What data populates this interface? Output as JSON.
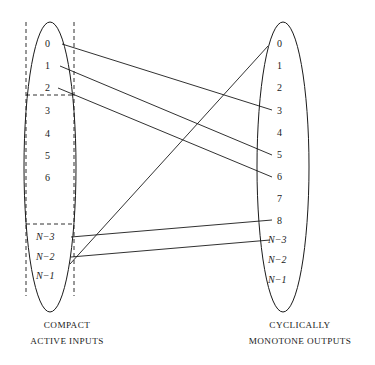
{
  "figure": {
    "type": "bipartite-mapping-diagram",
    "background": "#ffffff",
    "stroke_color": "#1a1a1a"
  },
  "left_set": {
    "name": "compact-active-inputs",
    "caption_line1": "COMPACT",
    "caption_line2": "ACTIVE INPUTS",
    "ellipse": {
      "cx": 50,
      "cy": 167,
      "rx": 26,
      "ry": 145
    },
    "items": [
      {
        "label": "0",
        "x": 45,
        "y": 45
      },
      {
        "label": "1",
        "x": 45,
        "y": 67
      },
      {
        "label": "2",
        "x": 45,
        "y": 89
      },
      {
        "label": "3",
        "x": 45,
        "y": 112
      },
      {
        "label": "4",
        "x": 45,
        "y": 135
      },
      {
        "label": "5",
        "x": 45,
        "y": 157
      },
      {
        "label": "6",
        "x": 45,
        "y": 179
      },
      {
        "label": "N−3",
        "x": 36,
        "y": 238
      },
      {
        "label": "N−2",
        "x": 36,
        "y": 258
      },
      {
        "label": "N−1",
        "x": 36,
        "y": 277
      }
    ]
  },
  "right_set": {
    "name": "cyclically-monotone-outputs",
    "caption_line1": "CYCLICALLY",
    "caption_line2": "MONOTONE OUTPUTS",
    "ellipse": {
      "cx": 283,
      "cy": 167,
      "rx": 26,
      "ry": 145
    },
    "items": [
      {
        "label": "0",
        "x": 277,
        "y": 45
      },
      {
        "label": "1",
        "x": 277,
        "y": 67
      },
      {
        "label": "2",
        "x": 277,
        "y": 89
      },
      {
        "label": "3",
        "x": 277,
        "y": 112
      },
      {
        "label": "4",
        "x": 277,
        "y": 134
      },
      {
        "label": "5",
        "x": 277,
        "y": 156
      },
      {
        "label": "6",
        "x": 277,
        "y": 178
      },
      {
        "label": "7",
        "x": 277,
        "y": 200
      },
      {
        "label": "8",
        "x": 277,
        "y": 222
      },
      {
        "label": "N−3",
        "x": 268,
        "y": 241
      },
      {
        "label": "N−2",
        "x": 268,
        "y": 261
      },
      {
        "label": "N−1",
        "x": 268,
        "y": 281
      }
    ]
  },
  "mappings": [
    {
      "from": "0",
      "to": "3",
      "x1": 62,
      "y1": 44,
      "x2": 272,
      "y2": 110
    },
    {
      "from": "1",
      "to": "5",
      "x1": 60,
      "y1": 66,
      "x2": 272,
      "y2": 155
    },
    {
      "from": "2",
      "to": "6",
      "x1": 58,
      "y1": 88,
      "x2": 272,
      "y2": 177
    },
    {
      "from": "N−3",
      "to": "8",
      "x1": 71,
      "y1": 237,
      "x2": 272,
      "y2": 220
    },
    {
      "from": "N−2",
      "to": "N−3",
      "x1": 71,
      "y1": 257,
      "x2": 270,
      "y2": 240
    },
    {
      "from": "N−1",
      "to": "0",
      "x1": 70,
      "y1": 264,
      "x2": 268,
      "y2": 46
    }
  ],
  "dashed_guides": {
    "vertical_left": {
      "x": 26,
      "y1": 22,
      "y2": 296
    },
    "vertical_right": {
      "x": 74,
      "y1": 22,
      "y2": 296
    },
    "horizontal_top": {
      "x1": 26,
      "x2": 74,
      "y": 95
    },
    "horizontal_bottom": {
      "x1": 26,
      "x2": 74,
      "y": 224
    }
  },
  "captions": {
    "left": {
      "x": 67,
      "y1": 328,
      "y2": 344
    },
    "right": {
      "x": 300,
      "y1": 328,
      "y2": 344
    }
  }
}
